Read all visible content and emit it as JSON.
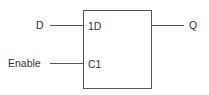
{
  "diagram": {
    "block": {
      "inputs": [
        {
          "pin_label": "1D",
          "signal": "D"
        },
        {
          "pin_label": "C1",
          "signal": "Enable"
        }
      ],
      "outputs": [
        {
          "signal": "Q"
        }
      ]
    },
    "colors": {
      "line": "#555555",
      "text": "#333333",
      "background": "#ffffff"
    }
  }
}
